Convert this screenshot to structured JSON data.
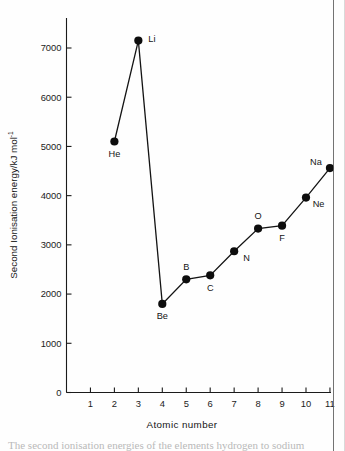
{
  "chart_data": {
    "type": "line",
    "title": "",
    "xlabel": "Atomic  number",
    "ylabel": "Second Ionisation energy/kJ mol",
    "ylabel_superscript": "-1",
    "xlim": [
      0,
      11.7
    ],
    "ylim": [
      0,
      7450
    ],
    "grid": false,
    "legend": null,
    "x": [
      2,
      3,
      4,
      5,
      6,
      7,
      8,
      9,
      10,
      11
    ],
    "values": [
      5100,
      7150,
      1800,
      2300,
      2380,
      2870,
      3330,
      3390,
      3960,
      4560
    ],
    "point_labels": [
      "He",
      "Li",
      "Be",
      "B",
      "C",
      "N",
      "O",
      "F",
      "Ne",
      "Na"
    ],
    "points": [
      {
        "label": "He",
        "x": 2,
        "y": 5100,
        "label_pos": "below"
      },
      {
        "label": "Li",
        "x": 3,
        "y": 7150,
        "label_pos": "right"
      },
      {
        "label": "Be",
        "x": 4,
        "y": 1800,
        "label_pos": "below"
      },
      {
        "label": "B",
        "x": 5,
        "y": 2300,
        "label_pos": "above"
      },
      {
        "label": "C",
        "x": 6,
        "y": 2380,
        "label_pos": "below"
      },
      {
        "label": "N",
        "x": 7,
        "y": 2870,
        "label_pos": "below-right"
      },
      {
        "label": "O",
        "x": 8,
        "y": 3330,
        "label_pos": "above"
      },
      {
        "label": "F",
        "x": 9,
        "y": 3390,
        "label_pos": "below"
      },
      {
        "label": "Ne",
        "x": 10,
        "y": 3960,
        "label_pos": "below-right"
      },
      {
        "label": "Na",
        "x": 11,
        "y": 4560,
        "label_pos": "above-left"
      }
    ],
    "xticks": [
      1,
      2,
      3,
      4,
      5,
      6,
      7,
      8,
      9,
      10,
      11
    ],
    "xtick_labels": [
      "1",
      "2",
      "3",
      "4",
      "5",
      "6",
      "7",
      "8",
      "9",
      "10",
      "11"
    ],
    "yticks": [
      0,
      1000,
      2000,
      3000,
      4000,
      5000,
      6000,
      7000
    ],
    "ytick_labels": [
      "0",
      "1000",
      "2000",
      "3000",
      "4000",
      "5000",
      "6000",
      "7000"
    ],
    "series_color": "#141414",
    "marker_color": "#0d0d0d",
    "axis_color": "#1b1b1b"
  },
  "caption": {
    "text": "The second ionisation energies of the elements hydrogen to sodium"
  }
}
